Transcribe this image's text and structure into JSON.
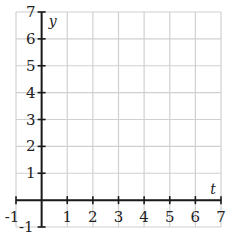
{
  "chart_data": {
    "type": "line",
    "title": "",
    "xlabel": "t",
    "ylabel": "y",
    "xlim": [
      -1,
      7
    ],
    "ylim": [
      -1,
      7
    ],
    "x_ticks": [
      -1,
      1,
      2,
      3,
      4,
      5,
      6,
      7
    ],
    "y_ticks": [
      -1,
      1,
      2,
      3,
      4,
      5,
      6,
      7
    ],
    "x_tick_labels": [
      "-1",
      "1",
      "2",
      "3",
      "4",
      "5",
      "6",
      "7"
    ],
    "y_tick_labels": [
      "-1",
      "1",
      "2",
      "3",
      "4",
      "5",
      "6",
      "7"
    ],
    "grid": true,
    "grid_step": 1,
    "series": [],
    "legend": null
  },
  "colors": {
    "grid": "#d0d0d0",
    "axis": "#1a1a1a",
    "text": "#222222",
    "background": "#ffffff"
  }
}
